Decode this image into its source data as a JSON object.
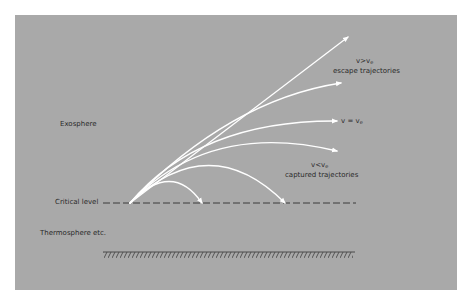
{
  "diagram": {
    "regions": {
      "upper": "Exosphere",
      "lower": "Thermosphere etc."
    },
    "critical_level_label": "Critical level",
    "escape": {
      "condition_v": "v",
      "condition_op": ">",
      "condition_ve": "v",
      "condition_sub": "e",
      "caption": "escape trajectories"
    },
    "threshold": {
      "condition_v": "v",
      "condition_op": "=",
      "condition_ve": "v",
      "condition_sub": "e"
    },
    "captured": {
      "condition_v": "v",
      "condition_op": "<",
      "condition_ve": "v",
      "condition_sub": "e",
      "caption": "captured trajectories"
    },
    "colors": {
      "background": "#a9a9a9",
      "trajectory": "#ffffff",
      "text": "#2a2a2a",
      "dashed_line": "#3a3a3a",
      "ground": "#4a4a4a"
    }
  }
}
